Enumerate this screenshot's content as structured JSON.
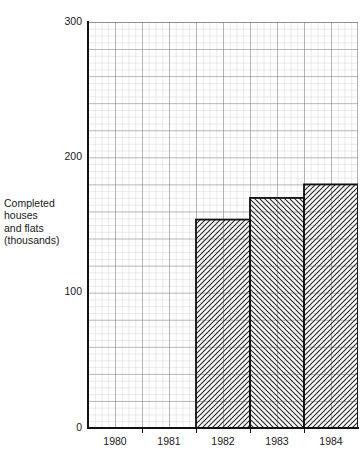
{
  "chart_data": {
    "type": "bar",
    "title": "",
    "subtitle": "",
    "xlabel": "",
    "ylabel": "Completed houses and flats (thousands)",
    "ylabel_lines": [
      "Completed",
      "houses",
      "and flats",
      "(thousands)"
    ],
    "categories": [
      "1980",
      "1981",
      "1982",
      "1983",
      "1984"
    ],
    "values": [
      212,
      177,
      154,
      170,
      180
    ],
    "ylim": [
      0,
      300
    ],
    "yticks": [
      0,
      100,
      200,
      300
    ],
    "ytick_labels": [
      "0",
      "100",
      "200",
      "300"
    ],
    "xtick_labels": [
      "1980",
      "1981",
      "1982",
      "1983",
      "1984"
    ],
    "grid": true,
    "grid_style": "graph-paper minor and major squares",
    "legend": null,
    "legend_position": "none",
    "series": [
      {
        "name": "Completed houses and flats (thousands)",
        "values": [
          212,
          177,
          154,
          170,
          180
        ]
      }
    ],
    "bar_fill": "#b5b5b5",
    "bar_hatch": [
      "forward-diagonal",
      "back-diagonal",
      "forward-diagonal",
      "back-diagonal",
      "forward-diagonal"
    ],
    "bar_edge_color": "#111111",
    "grid_minor_color": "#b9b9b9",
    "grid_major_color": "#6f6f6f",
    "background_color": "#ffffff",
    "text_color": "#1a1a1a"
  },
  "axis": {
    "y_ticks": [
      {
        "label": "300",
        "value": 300
      },
      {
        "label": "200",
        "value": 200
      },
      {
        "label": "100",
        "value": 100
      },
      {
        "label": "0",
        "value": 0
      }
    ],
    "x_ticks": [
      {
        "label": "1980"
      },
      {
        "label": "1981"
      },
      {
        "label": "1982"
      },
      {
        "label": "1983"
      },
      {
        "label": "1984"
      }
    ]
  }
}
